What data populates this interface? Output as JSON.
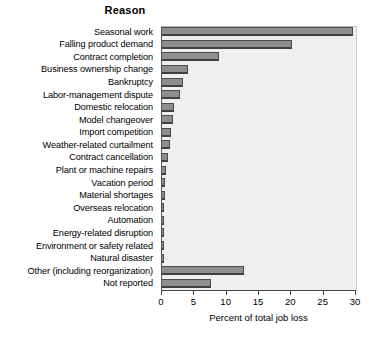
{
  "chart_data": {
    "type": "bar",
    "orientation": "horizontal",
    "title": "Reason",
    "xlabel": "Percent of total job loss",
    "ylabel": "",
    "xlim": [
      0,
      30
    ],
    "xticks": [
      0,
      5,
      10,
      15,
      20,
      25,
      30
    ],
    "grid": false,
    "legend": null,
    "categories": [
      "Seasonal work",
      "Falling product demand",
      "Contract completion",
      "Business ownership change",
      "Bankruptcy",
      "Labor-management dispute",
      "Domestic relocation",
      "Model changeover",
      "Import competition",
      "Weather-related curtailment",
      "Contract cancellation",
      "Plant or machine repairs",
      "Vacation period",
      "Material shortages",
      "Overseas relocation",
      "Automation",
      "Energy-related disruption",
      "Environment or safety related",
      "Natural disaster",
      "Other (including reorganization)",
      "Not reported"
    ],
    "values": [
      29.5,
      20.1,
      8.8,
      4.0,
      3.2,
      2.8,
      1.9,
      1.7,
      1.4,
      1.2,
      0.9,
      0.6,
      0.4,
      0.4,
      0.2,
      0.2,
      0.2,
      0.2,
      0.1,
      12.7,
      7.6
    ]
  },
  "style": {
    "plot_background": "#efefef",
    "bar_color": "#8e8e8e",
    "bar_edge_color": "#4a4a4a",
    "page_background": "#ffffff",
    "text_color": "#000000"
  }
}
